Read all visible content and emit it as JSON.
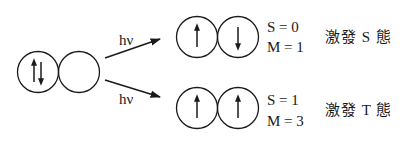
{
  "diagram": {
    "ground_state": {
      "orbitals": [
        {
          "spins": [
            "up",
            "down"
          ]
        },
        {
          "spins": []
        }
      ]
    },
    "arrows": [
      {
        "label": "hν",
        "to": "singlet"
      },
      {
        "label": "hν",
        "to": "triplet"
      }
    ],
    "singlet": {
      "orbitals": [
        {
          "spins": [
            "up"
          ]
        },
        {
          "spins": [
            "down"
          ]
        }
      ],
      "S_label": "S = 0",
      "M_label": "M = 1",
      "state_label": "激發 S 態"
    },
    "triplet": {
      "orbitals": [
        {
          "spins": [
            "up"
          ]
        },
        {
          "spins": [
            "up"
          ]
        }
      ],
      "S_label": "S = 1",
      "M_label": "M = 3",
      "state_label": "激發 T 態"
    }
  },
  "colors": {
    "stroke": "#1a1a1a",
    "background": "#ffffff"
  }
}
